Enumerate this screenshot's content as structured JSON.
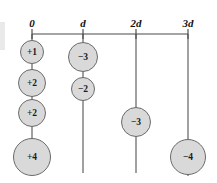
{
  "figure": {
    "colors": {
      "circle_fill": "#d9d9d9",
      "circle_stroke": "#6b6b6b",
      "line": "#4a4a4a",
      "text": "#111111",
      "background": "#ffffff"
    },
    "axis": {
      "name": "horizontal-position-axis",
      "y": 34,
      "x_start": 32,
      "x_end": 188,
      "tick_length": 5,
      "ticks": [
        {
          "label": "0",
          "x": 32,
          "label_x": 32,
          "label_y": 27
        },
        {
          "label": "d",
          "x": 83,
          "label_x": 83,
          "label_y": 27
        },
        {
          "label": "2d",
          "x": 136,
          "label_x": 136,
          "label_y": 27
        },
        {
          "label": "3d",
          "x": 188,
          "label_x": 188,
          "label_y": 27
        }
      ]
    },
    "columns": [
      {
        "name": "column-0",
        "tick_label": "0",
        "x": 32,
        "line_from_y": 34,
        "line_to_y": 175,
        "charges": [
          {
            "label": "+1",
            "value": "+1",
            "cx": 32,
            "cy": 52,
            "r": 11.5
          },
          {
            "label": "+2",
            "value": "+2",
            "cx": 32,
            "cy": 83,
            "r": 13.5
          },
          {
            "label": "+2",
            "value": "+2",
            "cx": 32,
            "cy": 113,
            "r": 13.5
          },
          {
            "label": "+4",
            "value": "+4",
            "cx": 32,
            "cy": 157,
            "r": 18.5
          }
        ]
      },
      {
        "name": "column-d",
        "tick_label": "d",
        "x": 83,
        "line_from_y": 34,
        "line_to_y": 173,
        "charges": [
          {
            "label": "−3",
            "value": "-3",
            "cx": 83,
            "cy": 57,
            "r": 14.5
          },
          {
            "label": "−2",
            "value": "-2",
            "cx": 83,
            "cy": 89,
            "r": 11.5
          }
        ]
      },
      {
        "name": "column-2d",
        "tick_label": "2d",
        "x": 136,
        "line_from_y": 34,
        "line_to_y": 173,
        "charges": [
          {
            "label": "−3",
            "value": "-3",
            "cx": 136,
            "cy": 122,
            "r": 14.5
          }
        ]
      },
      {
        "name": "column-3d",
        "tick_label": "3d",
        "x": 188,
        "line_from_y": 34,
        "line_to_y": 176,
        "charges": [
          {
            "label": "−4",
            "value": "-4",
            "cx": 188,
            "cy": 157,
            "r": 17.5
          }
        ]
      }
    ]
  },
  "chart_data": {
    "type": "scatter",
    "title": "",
    "xlabel": "",
    "ylabel": "",
    "x_tick_labels": [
      "0",
      "d",
      "2d",
      "3d"
    ],
    "x_tick_values": [
      0,
      1,
      2,
      3
    ],
    "grid": false,
    "legend": null,
    "series": [
      {
        "name": "charges at 0",
        "x_label": "0",
        "values": [
          "+1",
          "+2",
          "+2",
          "+4"
        ]
      },
      {
        "name": "charges at d",
        "x_label": "d",
        "values": [
          "−3",
          "−2"
        ]
      },
      {
        "name": "charges at 2d",
        "x_label": "2d",
        "values": [
          "−3"
        ]
      },
      {
        "name": "charges at 3d",
        "x_label": "3d",
        "values": [
          "−4"
        ]
      }
    ]
  }
}
